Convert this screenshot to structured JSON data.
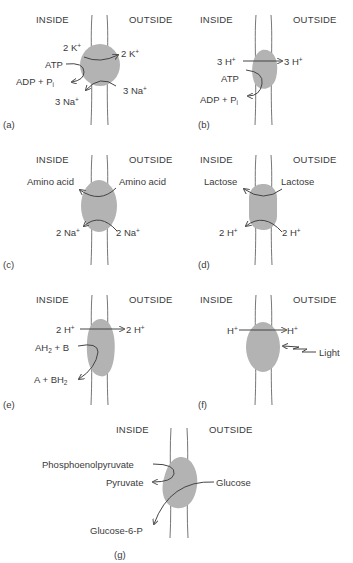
{
  "figure": {
    "headers": {
      "inside": "INSIDE",
      "outside": "OUTSIDE"
    },
    "colors": {
      "protein": "#b3b3b3",
      "membrane_line": "#666666",
      "arrow": "#555555",
      "text": "#3a3a3a"
    },
    "panels": [
      {
        "tag": "(a)",
        "name": "Na/K ATPase",
        "labels": {
          "k_in": "2 K",
          "k_in_sup": "+",
          "k_out": "2 K",
          "k_out_sup": "+",
          "atp": "ATP",
          "adp": "ADP + P",
          "adp_sub": "i",
          "na_out": "3 Na",
          "na_out_sup": "+",
          "na_in": "3 Na",
          "na_in_sup": "+"
        }
      },
      {
        "tag": "(b)",
        "name": "H+ ATPase",
        "labels": {
          "h_in": "3 H",
          "h_in_sup": "+",
          "h_out": "3 H",
          "h_out_sup": "+",
          "atp": "ATP",
          "adp": "ADP + P",
          "adp_sub": "i"
        }
      },
      {
        "tag": "(c)",
        "name": "Na/amino acid symport",
        "labels": {
          "aa_in": "Amino acid",
          "aa_out": "Amino acid",
          "na_in": "2 Na",
          "na_in_sup": "+",
          "na_out": "2 Na",
          "na_out_sup": "+"
        }
      },
      {
        "tag": "(d)",
        "name": "H/lactose symport",
        "labels": {
          "lac_in": "Lactose",
          "lac_out": "Lactose",
          "h_in": "2 H",
          "h_in_sup": "+",
          "h_out": "2 H",
          "h_out_sup": "+"
        }
      },
      {
        "tag": "(e)",
        "name": "Redox-driven proton pump",
        "labels": {
          "h_in": "2 H",
          "h_in_sup": "+",
          "h_out": "2 H",
          "h_out_sup": "+",
          "ah2": "AH",
          "ah2_sub": "2",
          "ah2_tail": " + B",
          "a_bh": "A + BH",
          "a_bh_sub": "2"
        }
      },
      {
        "tag": "(f)",
        "name": "Light-driven proton pump",
        "labels": {
          "h_in": "H",
          "h_in_sup": "+",
          "h_out": "H",
          "h_out_sup": "+",
          "light": "Light"
        }
      },
      {
        "tag": "(g)",
        "name": "Phosphotransferase system",
        "labels": {
          "pep": "Phosphoenolpyruvate",
          "pyr": "Pyruvate",
          "glc": "Glucose",
          "g6p": "Glucose-6-P"
        }
      }
    ]
  }
}
